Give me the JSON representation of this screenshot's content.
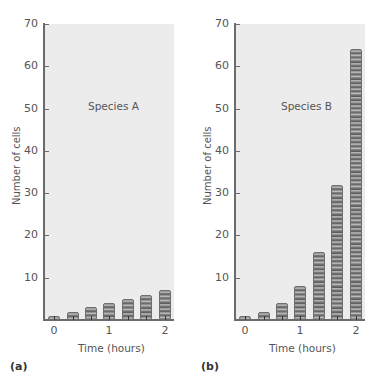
{
  "chart_data": [
    {
      "type": "bar",
      "panel_label": "(a)",
      "title": "Species A",
      "xlabel": "Time (hours)",
      "ylabel": "Number of cells",
      "ylim": [
        0,
        70
      ],
      "yticks": [
        10,
        20,
        30,
        40,
        50,
        60,
        70
      ],
      "xticks": [
        "0",
        "1",
        "2"
      ],
      "x": [
        0,
        0.33,
        0.67,
        1,
        1.33,
        1.67,
        2
      ],
      "values": [
        1,
        2,
        3,
        4,
        5,
        6,
        7
      ],
      "grid": false,
      "legend": null
    },
    {
      "type": "bar",
      "panel_label": "(b)",
      "title": "Species B",
      "xlabel": "Time (hours)",
      "ylabel": "Number of cells",
      "ylim": [
        0,
        70
      ],
      "yticks": [
        10,
        20,
        30,
        40,
        50,
        60,
        70
      ],
      "xticks": [
        "0",
        "1",
        "2"
      ],
      "x": [
        0,
        0.33,
        0.67,
        1,
        1.33,
        1.67,
        2
      ],
      "values": [
        1,
        2,
        4,
        8,
        16,
        32,
        64
      ],
      "grid": false,
      "legend": null
    }
  ],
  "panels": [
    {
      "label": "(a)",
      "species": "Species A",
      "xlabel": "Time (hours)",
      "ylabel": "Number of cells"
    },
    {
      "label": "(b)",
      "species": "Species B",
      "xlabel": "Time (hours)",
      "ylabel": "Number of cells"
    }
  ],
  "colors": {
    "plot_background": "#ececec",
    "axis": "#6b6b6b",
    "bar_disc": "#7a7a7a",
    "text": "#555555"
  }
}
